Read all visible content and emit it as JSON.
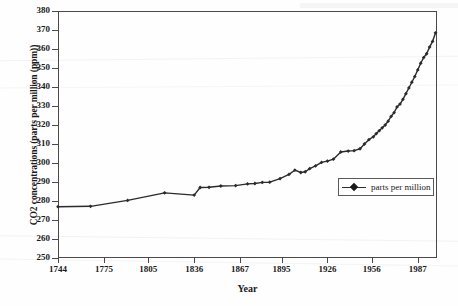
{
  "chart_data": {
    "type": "line",
    "title": "",
    "xlabel": "Year",
    "ylabel": "CO2 concentrations (parts per million (ppm))",
    "ylim": [
      250,
      380
    ],
    "xlim": [
      1744,
      2000
    ],
    "y_ticks": [
      250,
      260,
      270,
      280,
      290,
      300,
      310,
      320,
      330,
      340,
      350,
      360,
      370,
      380
    ],
    "x_ticks": [
      1744,
      1775,
      1805,
      1836,
      1867,
      1895,
      1926,
      1956,
      1987
    ],
    "grid": false,
    "legend_position": "inside-right",
    "series": [
      {
        "name": "parts per million",
        "color": "#2b2b2b",
        "marker": "diamond",
        "x": [
          1744,
          1766,
          1791,
          1816,
          1836,
          1840,
          1846,
          1854,
          1864,
          1872,
          1877,
          1882,
          1887,
          1894,
          1900,
          1904,
          1908,
          1911,
          1914,
          1918,
          1922,
          1926,
          1930,
          1935,
          1940,
          1944,
          1948,
          1951,
          1954,
          1957,
          1959,
          1961,
          1963,
          1965,
          1967,
          1969,
          1971,
          1973,
          1975,
          1977,
          1979,
          1981,
          1983,
          1985,
          1987,
          1989,
          1991,
          1993,
          1995,
          1997,
          1999
        ],
        "y": [
          277.0,
          277.2,
          280.3,
          284.3,
          283.1,
          287.1,
          287.2,
          287.9,
          288.1,
          289.0,
          289.2,
          289.8,
          289.9,
          291.8,
          294.0,
          296.2,
          295.0,
          295.4,
          297.0,
          298.5,
          300.3,
          301.0,
          302.0,
          305.8,
          306.3,
          306.5,
          307.5,
          310.0,
          312.3,
          313.8,
          315.5,
          317.0,
          318.5,
          320.0,
          322.0,
          324.5,
          326.5,
          329.5,
          331.0,
          333.5,
          336.5,
          339.5,
          342.5,
          345.5,
          349.0,
          352.5,
          355.5,
          357.5,
          361.0,
          364.0,
          368.5
        ]
      }
    ]
  },
  "axes": {
    "y_title": "CO2 concentrations (parts per million (ppm))",
    "x_title": "Year"
  },
  "legend": {
    "entries": [
      {
        "label": "parts per million"
      }
    ]
  }
}
